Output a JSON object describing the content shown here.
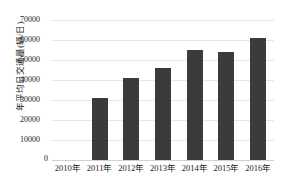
{
  "chart_data": {
    "type": "bar",
    "title": "",
    "xlabel": "",
    "ylabel": "年平均日交通量(辆/日)",
    "categories": [
      "2010年",
      "2011年",
      "2012年",
      "2013年",
      "2014年",
      "2015年",
      "2016年"
    ],
    "values": [
      0,
      31000,
      41000,
      46000,
      55000,
      54000,
      61000
    ],
    "series": [
      {
        "name": "年平均日交通量",
        "values": [
          0,
          31000,
          41000,
          46000,
          55000,
          54000,
          61000
        ]
      }
    ],
    "ylim": [
      0,
      70000
    ],
    "yticks": [
      0,
      10000,
      20000,
      30000,
      40000,
      50000,
      60000,
      70000
    ],
    "ytick_labels": [
      "0",
      "10000",
      "20000",
      "30000",
      "40000",
      "50000",
      "60000",
      "70000"
    ],
    "grid": true,
    "legend": false,
    "bar_color": "#3b3b3b",
    "gridline_color": "#e6e6e6",
    "background_color": "#ffffff"
  }
}
